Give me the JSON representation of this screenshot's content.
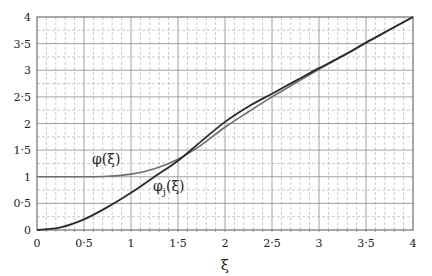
{
  "chart_data": {
    "type": "line",
    "title": "",
    "xlabel": "ξ",
    "ylabel": "",
    "xlim": [
      0,
      4
    ],
    "ylim": [
      0,
      4
    ],
    "grid": true,
    "legend_position": "none (inline curve labels)",
    "x_ticks": [
      "0",
      "0·5",
      "1",
      "1·5",
      "2",
      "2·5",
      "3",
      "3·5",
      "4"
    ],
    "y_ticks": [
      "0",
      "0·5",
      "1",
      "1·5",
      "2",
      "2·5",
      "3",
      "3·5",
      "4"
    ],
    "x": [
      0,
      0.25,
      0.5,
      0.75,
      1.0,
      1.25,
      1.5,
      1.75,
      2.0,
      2.25,
      2.5,
      2.75,
      3.0,
      3.25,
      3.5,
      3.75,
      4.0
    ],
    "series": [
      {
        "name": "φ(ξ)",
        "color": "#6e6e6e",
        "values": [
          1.0,
          1.0,
          1.0,
          1.01,
          1.05,
          1.15,
          1.33,
          1.6,
          1.93,
          2.22,
          2.5,
          2.76,
          3.02,
          3.26,
          3.51,
          3.76,
          4.0
        ]
      },
      {
        "name": "φⱼ(ξ)",
        "color": "#2a2a2a",
        "values": [
          0.0,
          0.05,
          0.2,
          0.43,
          0.7,
          1.0,
          1.3,
          1.67,
          2.03,
          2.32,
          2.56,
          2.8,
          3.04,
          3.27,
          3.52,
          3.76,
          4.0
        ]
      }
    ],
    "annotations": [
      {
        "text": "φ(ξ)",
        "x": 0.95,
        "y": 1.22
      },
      {
        "text": "φⱼ(ξ)",
        "x": 1.25,
        "y": 0.78
      }
    ]
  },
  "labels": {
    "x_axis_title": "ξ",
    "phi_label": "φ(ξ)",
    "phij_label_main": "φ",
    "phij_label_sub": "j",
    "phij_label_tail": "(ξ)"
  }
}
